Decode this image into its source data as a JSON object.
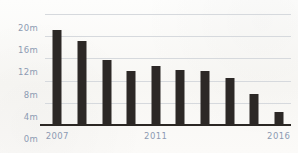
{
  "chart_data": {
    "type": "bar",
    "title": "",
    "xlabel": "",
    "ylabel": "",
    "categories": [
      "2007",
      "2008",
      "2009",
      "2010",
      "2011",
      "2012",
      "2013",
      "2014",
      "2015",
      "2016"
    ],
    "values": [
      17.2,
      15.2,
      11.8,
      9.8,
      10.6,
      10.0,
      9.8,
      8.4,
      5.6,
      2.4
    ],
    "ylim": [
      0,
      20
    ],
    "yticks": [
      0,
      4,
      8,
      12,
      16,
      20
    ],
    "ytick_labels": [
      "0m",
      "4m",
      "8m",
      "12m",
      "16m",
      "20m"
    ],
    "visible_xtick_labels": [
      "2007",
      "2011",
      "2016"
    ],
    "grid": true,
    "legend": "none",
    "unit_suffix": "m",
    "bar_color": "#2c2826",
    "gridline_color": "#d6d9dd",
    "axis_label_color": "#8d9bb3",
    "baseline_color": "#2b2724",
    "background_color": "#fbfaf8"
  }
}
